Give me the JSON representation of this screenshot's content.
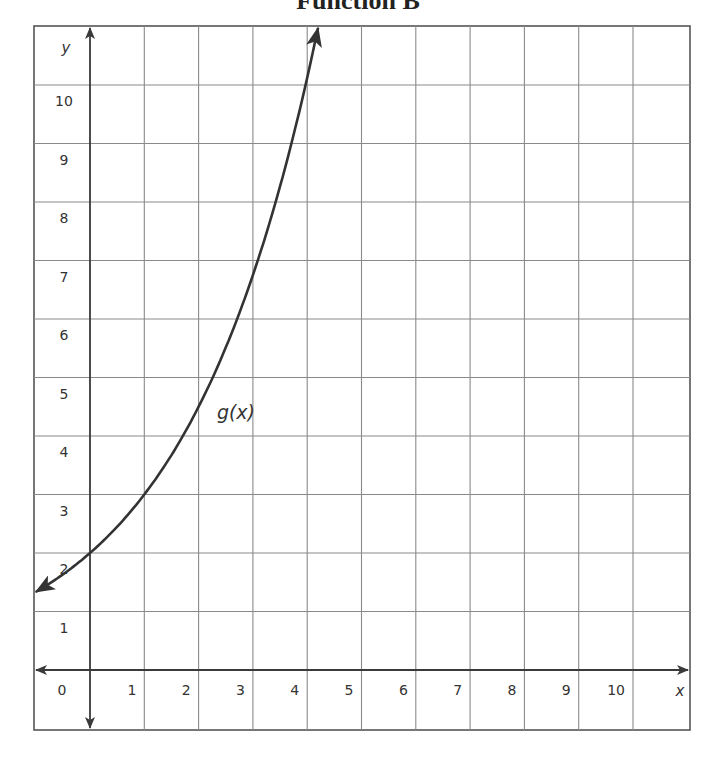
{
  "title": "Function B",
  "chart_data": {
    "type": "line",
    "title": "Function B",
    "xlabel": "x",
    "ylabel": "y",
    "xlim": [
      -1,
      11
    ],
    "ylim": [
      -1,
      11
    ],
    "grid": true,
    "x_ticks": [
      "0",
      "1",
      "2",
      "3",
      "4",
      "5",
      "6",
      "7",
      "8",
      "9",
      "10"
    ],
    "y_ticks": [
      "1",
      "2",
      "3",
      "4",
      "5",
      "6",
      "7",
      "8",
      "9",
      "10"
    ],
    "series": [
      {
        "name": "g(x)",
        "label": "g(x)",
        "arrows": "both ends",
        "x": [
          -1,
          0,
          1,
          2,
          3,
          4,
          4.2
        ],
        "values": [
          1.33,
          2,
          3,
          4.5,
          6.75,
          10.1,
          11
        ]
      }
    ],
    "annotations": [
      {
        "text": "g(x)",
        "x": 2.3,
        "y": 4.5
      }
    ]
  },
  "colors": {
    "grid": "#8a8a8a",
    "axis": "#3a3a3a",
    "curve": "#333333",
    "text": "#333333"
  }
}
